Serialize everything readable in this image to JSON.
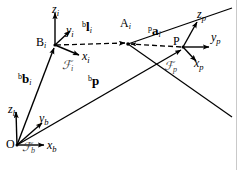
{
  "figure": {
    "type": "vector-kinematics-diagram",
    "background_color": "#ffffff",
    "stroke_color": "#000000",
    "width": 238,
    "height": 170
  },
  "points": [
    {
      "id": "O",
      "label": "O",
      "sub": "",
      "x": 17,
      "y": 145
    },
    {
      "id": "Bi",
      "label": "B",
      "sub": "i",
      "x": 55,
      "y": 45
    },
    {
      "id": "Ai",
      "label": "A",
      "sub": "i",
      "x": 128,
      "y": 44
    },
    {
      "id": "P",
      "label": "P",
      "sub": "",
      "x": 183,
      "y": 47
    }
  ],
  "frames": [
    {
      "id": "Fb",
      "symbol": "ℱ",
      "sub": "b",
      "origin_label": "O",
      "label_x": 22,
      "label_y": 141,
      "axes": [
        {
          "name": "x",
          "sub": "b",
          "label_x": 47,
          "label_y": 139
        },
        {
          "name": "y",
          "sub": "b",
          "label_x": 39,
          "label_y": 112
        },
        {
          "name": "z",
          "sub": "b",
          "label_x": 12,
          "label_y": 104
        }
      ]
    },
    {
      "id": "Fi",
      "symbol": "ℱ",
      "sub": "i",
      "origin_label": "B",
      "label_x": 62,
      "label_y": 59,
      "axes": [
        {
          "name": "x",
          "sub": "i",
          "label_x": 82,
          "label_y": 57
        },
        {
          "name": "y",
          "sub": "i",
          "label_x": 66,
          "label_y": 26
        },
        {
          "name": "z",
          "sub": "i",
          "label_x": 51,
          "label_y": 5
        }
      ]
    },
    {
      "id": "Fp",
      "symbol": "ℱ",
      "sub": "p",
      "origin_label": "P",
      "label_x": 164,
      "label_y": 60,
      "axes": [
        {
          "name": "x",
          "sub": "p",
          "label_x": 190,
          "label_y": 60
        },
        {
          "name": "y",
          "sub": "p",
          "label_x": 212,
          "label_y": 33
        },
        {
          "name": "z",
          "sub": "p",
          "label_x": 196,
          "label_y": 13
        }
      ]
    }
  ],
  "vectors": [
    {
      "id": "b_bi",
      "sup": "b",
      "symbol": "b",
      "sub": "i",
      "from": "O",
      "to": "Bi",
      "style": "solid",
      "label_x": 22,
      "label_y": 78
    },
    {
      "id": "b_li",
      "sup": "b",
      "symbol": "l",
      "sub": "i",
      "from": "Bi",
      "to": "Ai",
      "style": "dashed",
      "label_x": 85,
      "label_y": 26
    },
    {
      "id": "p_ai",
      "sup": "p",
      "symbol": "a",
      "sub": "i",
      "from": "P",
      "to": "Ai",
      "style": "dashed",
      "label_x": 152,
      "label_y": 29
    },
    {
      "id": "b_p",
      "sup": "b",
      "symbol": "p",
      "sub": "",
      "from": "O",
      "to": "P",
      "style": "solid",
      "label_x": 91,
      "label_y": 80
    }
  ],
  "platform_edges": [
    {
      "id": "edge-upper",
      "from": "Ai",
      "to_x": 232,
      "to_y": 8
    },
    {
      "id": "edge-lower",
      "from": "Ai",
      "to_x": 232,
      "to_y": 117
    }
  ]
}
